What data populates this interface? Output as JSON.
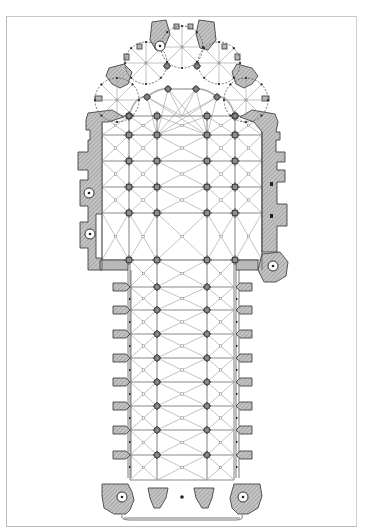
{
  "drawing": {
    "type": "architectural floor plan",
    "subject": "Gothic cathedral ground plan with chevet of radiating chapels, choir, transept zone and aisled nave",
    "colors": {
      "background": "#ffffff",
      "frame": "#b8b8b8",
      "wall_fill": "#b9b9b9",
      "wall_stroke": "#444444",
      "rib_lines": "#9a9a9a",
      "pier_fill": "#8c8c8c"
    },
    "frame": {
      "x": 6,
      "y": 16,
      "width": 351,
      "height": 511
    },
    "text_labels": []
  },
  "plan": {
    "choir_pier_columns_x": [
      129,
      157,
      207,
      235
    ],
    "choir_pier_rows_y": [
      116,
      135,
      161,
      187,
      213,
      260
    ],
    "nave_pier_columns_x": [
      130,
      157,
      207,
      234
    ],
    "nave_pier_rows_y": [
      287,
      310,
      334,
      358,
      382,
      406,
      430,
      455
    ],
    "nave_buttress_left_x": 113,
    "nave_buttress_right_x": 252,
    "radiating_chapels": [
      {
        "cx": 117,
        "cy": 100,
        "r": 22
      },
      {
        "cx": 146,
        "cy": 63,
        "r": 21
      },
      {
        "cx": 182,
        "cy": 47,
        "r": 21
      },
      {
        "cx": 219,
        "cy": 63,
        "r": 21
      },
      {
        "cx": 246,
        "cy": 100,
        "r": 22
      }
    ],
    "stair_turrets": [
      {
        "cx": 89,
        "cy": 193
      },
      {
        "cx": 90,
        "cy": 234
      },
      {
        "cx": 273,
        "cy": 266
      },
      {
        "cx": 122,
        "cy": 497
      },
      {
        "cx": 243,
        "cy": 497
      },
      {
        "cx": 160,
        "cy": 46
      }
    ]
  }
}
